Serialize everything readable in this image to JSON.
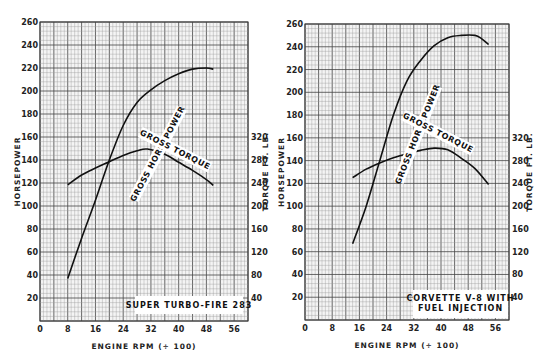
{
  "chart_data": [
    {
      "type": "line",
      "title": "SUPER TURBO-FIRE 283",
      "xlabel": "ENGINE RPM (÷ 100)",
      "ylabel": "HORSEPOWER",
      "y2label": "TORQUE FT. LB.",
      "xlim": [
        0,
        60
      ],
      "ylim": [
        0,
        260
      ],
      "y2lim": [
        0,
        520
      ],
      "xticks": [
        "0",
        "8",
        "16",
        "24",
        "32",
        "40",
        "48",
        "56"
      ],
      "yticks": [
        "20",
        "40",
        "60",
        "80",
        "100",
        "120",
        "140",
        "160",
        "180",
        "200",
        "220",
        "240",
        "260"
      ],
      "y2ticks": [
        "40",
        "80",
        "120",
        "160",
        "200",
        "240",
        "280",
        "320"
      ],
      "grid": true,
      "series": [
        {
          "name": "GROSS HORSEPOWER",
          "axis": "left",
          "x": [
            8,
            12,
            16,
            20,
            24,
            28,
            32,
            36,
            40,
            44,
            48,
            50
          ],
          "y": [
            37,
            72,
            105,
            140,
            170,
            190,
            201,
            209,
            215,
            219,
            220,
            219
          ]
        },
        {
          "name": "GROSS TORQUE",
          "axis": "right",
          "x": [
            8,
            12,
            16,
            20,
            24,
            28,
            31,
            36,
            40,
            44,
            48,
            50
          ],
          "y": [
            237,
            254,
            266,
            277,
            288,
            296,
            299,
            290,
            276,
            262,
            246,
            236
          ]
        }
      ]
    },
    {
      "type": "line",
      "title": "CORVETTE V-8 WITH FUEL INJECTION",
      "title_lines": [
        "CORVETTE V-8 WITH",
        "FUEL INJECTION"
      ],
      "xlabel": "ENGINE RPM (÷ 100)",
      "ylabel": "HORSEPOWER",
      "y2label": "TORQUE FT. LB.",
      "xlim": [
        0,
        60
      ],
      "ylim": [
        0,
        260
      ],
      "y2lim": [
        0,
        520
      ],
      "xticks": [
        "0",
        "8",
        "16",
        "24",
        "32",
        "40",
        "48",
        "56"
      ],
      "yticks": [
        "20",
        "40",
        "60",
        "80",
        "100",
        "120",
        "140",
        "160",
        "180",
        "200",
        "220",
        "240",
        "260"
      ],
      "y2ticks": [
        "40",
        "80",
        "120",
        "160",
        "200",
        "240",
        "280",
        "320"
      ],
      "grid": true,
      "series": [
        {
          "name": "GROSS HORSEPOWER",
          "axis": "left",
          "x": [
            14,
            18,
            22,
            26,
            30,
            34,
            38,
            42,
            46,
            50,
            52,
            54
          ],
          "y": [
            67,
            100,
            140,
            180,
            210,
            228,
            241,
            248,
            250,
            250,
            247,
            242
          ]
        },
        {
          "name": "GROSS TORQUE",
          "axis": "right",
          "x": [
            14,
            18,
            22,
            26,
            30,
            34,
            38,
            42,
            46,
            50,
            54
          ],
          "y": [
            250,
            265,
            276,
            285,
            292,
            298,
            302,
            299,
            284,
            266,
            238
          ]
        }
      ]
    }
  ]
}
